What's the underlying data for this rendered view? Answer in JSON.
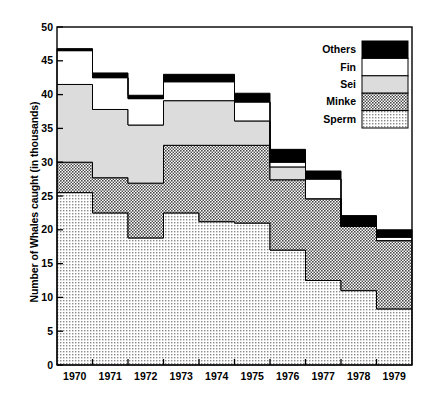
{
  "chart_data": {
    "type": "area",
    "title": "",
    "subtitle": "",
    "xlabel": "",
    "ylabel": "Number of Whales caught (in thousands)",
    "categories": [
      "1970",
      "1971",
      "1972",
      "1973",
      "1974",
      "1975",
      "1976",
      "1977",
      "1978",
      "1979"
    ],
    "xlim": [
      1969.5,
      1979.5
    ],
    "ylim": [
      0,
      50
    ],
    "yticks": [
      0,
      5,
      10,
      15,
      20,
      25,
      30,
      35,
      40,
      45,
      50
    ],
    "xticks": [
      "1970",
      "1971",
      "1972",
      "1973",
      "1974",
      "1975",
      "1976",
      "1977",
      "1978",
      "1979"
    ],
    "grid": false,
    "stacked": true,
    "step": true,
    "legend_position": "top-right",
    "series": [
      {
        "name": "Sperm",
        "fill": "dotted",
        "color": "#f2f2f2",
        "values": [
          25.5,
          22.5,
          18.8,
          22.5,
          21.2,
          21.0,
          17.0,
          12.5,
          11.0,
          8.3
        ]
      },
      {
        "name": "Minke",
        "fill": "hatched",
        "color": "#b4b4b4",
        "values": [
          4.5,
          5.2,
          8.1,
          10.0,
          11.3,
          11.5,
          10.4,
          12.1,
          9.5,
          10.1
        ]
      },
      {
        "name": "Sei",
        "fill": "solid",
        "color": "#dcdcdc",
        "values": [
          11.5,
          10.1,
          8.6,
          6.6,
          6.6,
          3.6,
          1.9,
          0.0,
          0.0,
          0.0
        ]
      },
      {
        "name": "Fin",
        "fill": "solid",
        "color": "#ffffff",
        "values": [
          5.0,
          4.7,
          3.9,
          2.8,
          2.8,
          2.8,
          0.7,
          2.9,
          0.0,
          0.5
        ]
      },
      {
        "name": "Others",
        "fill": "solid",
        "color": "#000000",
        "values": [
          0.3,
          0.7,
          0.5,
          1.1,
          1.1,
          1.3,
          1.9,
          1.2,
          1.6,
          1.1
        ]
      }
    ],
    "cumulative_tops": {
      "Sperm": [
        25.5,
        22.5,
        18.8,
        22.5,
        21.2,
        21.0,
        17.0,
        12.5,
        11.0,
        8.3
      ],
      "Minke": [
        30.0,
        27.7,
        26.9,
        32.5,
        32.5,
        32.5,
        27.4,
        24.6,
        20.5,
        18.4
      ],
      "Sei": [
        41.5,
        37.8,
        35.5,
        39.1,
        39.1,
        36.1,
        29.3,
        24.6,
        20.5,
        18.4
      ],
      "Fin": [
        46.5,
        42.5,
        39.4,
        41.9,
        41.9,
        38.9,
        30.0,
        27.5,
        20.5,
        18.9
      ],
      "Others": [
        46.8,
        43.2,
        39.9,
        43.0,
        43.0,
        40.2,
        31.9,
        28.7,
        22.1,
        20.0
      ]
    },
    "legend": [
      {
        "label": "Others",
        "swatch": "black"
      },
      {
        "label": "Fin",
        "swatch": "white"
      },
      {
        "label": "Sei",
        "swatch": "lightgray"
      },
      {
        "label": "Minke",
        "swatch": "hatched"
      },
      {
        "label": "Sperm",
        "swatch": "dotted"
      }
    ]
  },
  "colors": {
    "others": "#000000",
    "fin": "#ffffff",
    "sei": "#dcdcdc",
    "minke": "#b0b0b0",
    "sperm": "#f0f0f0",
    "axis": "#000000",
    "background": "#ffffff"
  }
}
